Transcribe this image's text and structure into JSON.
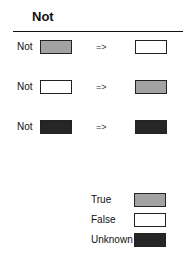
{
  "title": "Not",
  "colors": {
    "true": "#a2a2a2",
    "false": "#ffffff",
    "unknown": "#262626"
  },
  "rows": [
    {
      "operator": "Not",
      "input": "true",
      "arrow": "=>",
      "output": "false"
    },
    {
      "operator": "Not",
      "input": "false",
      "arrow": "=>",
      "output": "true"
    },
    {
      "operator": "Not",
      "input": "unknown",
      "arrow": "=>",
      "output": "unknown"
    }
  ],
  "legend": [
    {
      "label": "True",
      "value": "true"
    },
    {
      "label": "False",
      "value": "false"
    },
    {
      "label": "Unknown",
      "value": "unknown"
    }
  ]
}
